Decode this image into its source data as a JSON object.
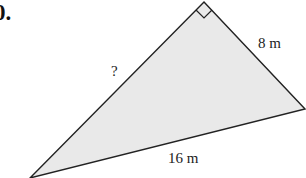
{
  "problem_number": "0.",
  "figure": {
    "type": "right-triangle",
    "fill_color": "#e9e9e9",
    "stroke_color": "#222222",
    "vertices": {
      "apex_right_angle": [
        204,
        2
      ],
      "right": [
        305,
        109
      ],
      "bottom_left": [
        30,
        178
      ]
    },
    "labels": {
      "hypotenuse_unknown": "?",
      "short_leg": "8 m",
      "long_side": "16 m"
    }
  }
}
